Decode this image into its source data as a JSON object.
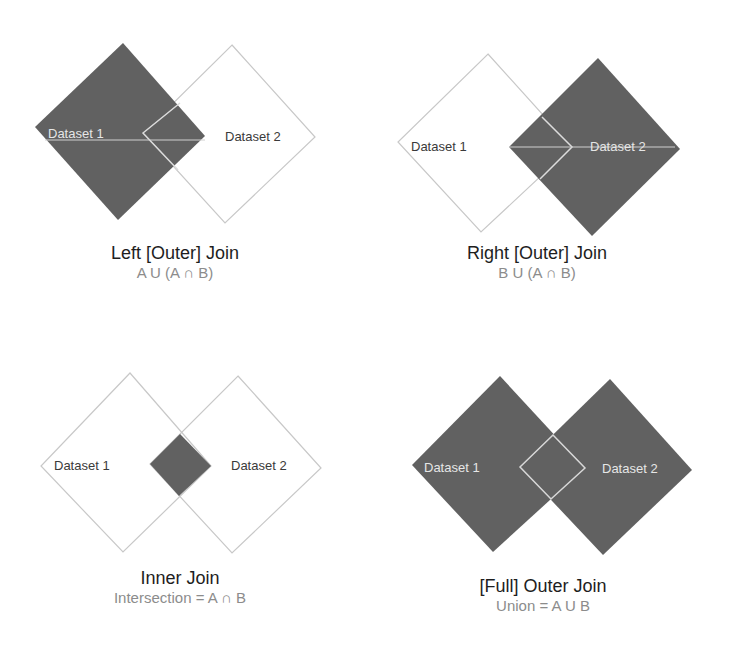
{
  "colors": {
    "fill": "#616161",
    "outline": "#c8c8c8",
    "light_text": "#e6e6e6",
    "dark_text": "#3a3a3a",
    "title": "#1e1e1e",
    "formula": "#8c8c8c",
    "background": "#ffffff"
  },
  "panels": [
    {
      "id": "left-join",
      "title": "Left [Outer] Join",
      "formula": "A U (A ∩ B)",
      "dataset1_label": "Dataset 1",
      "dataset2_label": "Dataset 2",
      "filled": "A"
    },
    {
      "id": "right-join",
      "title": "Right [Outer] Join",
      "formula": "B U (A ∩ B)",
      "dataset1_label": "Dataset 1",
      "dataset2_label": "Dataset 2",
      "filled": "B"
    },
    {
      "id": "inner-join",
      "title": "Inner Join",
      "formula": "Intersection = A ∩ B",
      "dataset1_label": "Dataset 1",
      "dataset2_label": "Dataset 2",
      "filled": "intersection"
    },
    {
      "id": "full-outer-join",
      "title": "[Full] Outer Join",
      "formula": "Union = A U B",
      "dataset1_label": "Dataset 1",
      "dataset2_label": "Dataset 2",
      "filled": "both"
    }
  ]
}
